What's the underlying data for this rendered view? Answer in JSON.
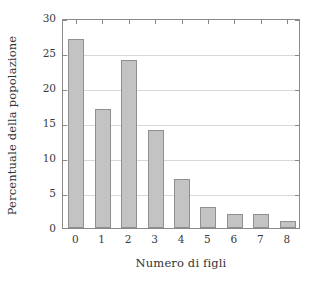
{
  "chart_data": {
    "type": "bar",
    "title": "",
    "xlabel": "Numero di figli",
    "ylabel": "Percentuale della popolazione",
    "categories": [
      "0",
      "1",
      "2",
      "3",
      "4",
      "5",
      "6",
      "7",
      "8"
    ],
    "values": [
      27,
      17,
      24,
      14,
      7,
      3,
      2,
      2,
      1
    ],
    "ylim": [
      0,
      30
    ],
    "yticks": [
      0,
      5,
      10,
      15,
      20,
      25,
      30
    ],
    "ytick_labels": [
      "0",
      "5",
      "10",
      "15",
      "20",
      "25",
      "30"
    ],
    "grid": "horizontal",
    "legend": "none",
    "bar_color": "#c3c3c3",
    "bar_edge_color": "#8f8f8f",
    "axis_color": "#8a8a8a",
    "grid_color": "#d8d8d8"
  }
}
